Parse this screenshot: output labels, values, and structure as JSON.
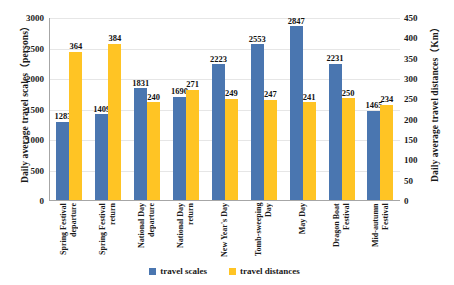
{
  "chart_data": {
    "type": "bar",
    "title": "",
    "categories": [
      "Spring Festival departure",
      "Spring Festival return",
      "National Day departure",
      "National Day return",
      "New Year's Day",
      "Tomb-sweeping Day",
      "May Day",
      "Dragon Boat Festival",
      "Mid-autumn Festival"
    ],
    "series": [
      {
        "name": "travel scales",
        "axis": "left",
        "color": "#4A76B0",
        "values": [
          1283,
          1409,
          1831,
          1690,
          2223,
          2553,
          2847,
          2231,
          1465
        ]
      },
      {
        "name": "travel distances",
        "axis": "right",
        "color": "#FFC424",
        "values": [
          364,
          384,
          240,
          271,
          249,
          247,
          241,
          250,
          234
        ]
      }
    ],
    "xlabel": "",
    "ylabel": "Daily average travel scales（persons）",
    "y2label": "Daily average travel distances（Km）",
    "ylim": [
      0,
      3000
    ],
    "y2lim": [
      0,
      450
    ],
    "yticks": [
      0,
      500,
      1000,
      1500,
      2000,
      2500,
      3000
    ],
    "y2ticks": [
      0,
      50,
      100,
      150,
      200,
      250,
      300,
      350,
      400,
      450
    ],
    "grid": true,
    "legend_position": "bottom"
  },
  "axes": {
    "left_title": "Daily average travel scales（persons）",
    "right_title": "Daily average travel distances（Km）"
  },
  "legend": {
    "items": [
      {
        "label": "travel scales"
      },
      {
        "label": "travel distances"
      }
    ]
  }
}
